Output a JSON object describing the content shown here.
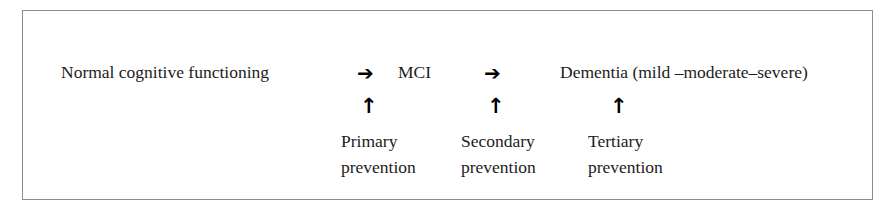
{
  "figure": {
    "type": "continuum-flow-diagram",
    "border_color": "#8d8d8d",
    "background_color": "#ffffff",
    "text_color": "#1c1c1c"
  },
  "stages": [
    {
      "id": "normal",
      "label": "Normal cognitive functioning"
    },
    {
      "id": "mci",
      "label": "MCI"
    },
    {
      "id": "dementia",
      "label": "Dementia (mild –moderate–severe)"
    }
  ],
  "flow_arrows": [
    {
      "id": "normal-to-mci",
      "glyph": "➔",
      "icon": "arrow-right-icon"
    },
    {
      "id": "mci-to-dementia",
      "glyph": "➔",
      "icon": "arrow-right-icon"
    }
  ],
  "up_arrows": [
    {
      "id": "primary",
      "glyph": "↑",
      "icon": "arrow-up-icon"
    },
    {
      "id": "secondary",
      "glyph": "↑",
      "icon": "arrow-up-icon"
    },
    {
      "id": "tertiary",
      "glyph": "↑",
      "icon": "arrow-up-icon"
    }
  ],
  "preventions": [
    {
      "id": "primary",
      "line1": "Primary",
      "line2": "prevention"
    },
    {
      "id": "secondary",
      "line1": "Secondary",
      "line2": "prevention"
    },
    {
      "id": "tertiary",
      "line1": "Tertiary",
      "line2": "prevention"
    }
  ]
}
